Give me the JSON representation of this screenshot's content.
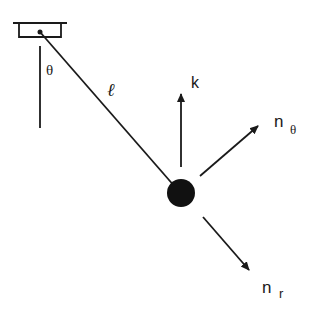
{
  "diagram": {
    "labels": {
      "theta": "θ",
      "length": "ℓ",
      "k": "k",
      "n_theta_main": "n",
      "n_theta_sub": "θ",
      "n_r_main": "n",
      "n_r_sub": "r"
    },
    "colors": {
      "stroke": "#1a1a1a",
      "background": "#ffffff"
    },
    "elements": [
      "ceiling-support",
      "pivot",
      "vertical-reference-line",
      "string",
      "bob",
      "k-vector",
      "n-theta-vector",
      "n-r-vector"
    ]
  }
}
